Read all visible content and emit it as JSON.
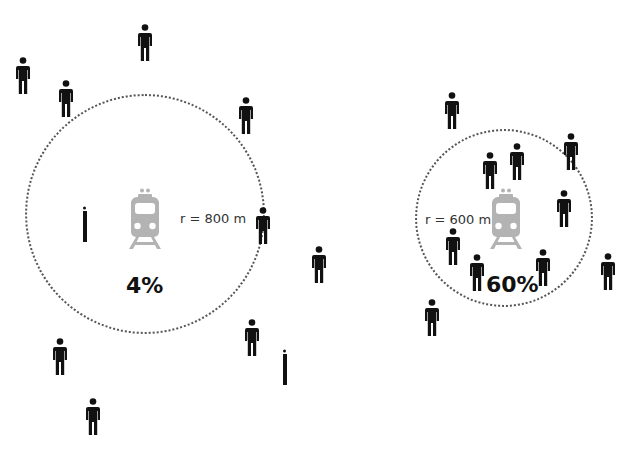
{
  "diagrams": [
    {
      "id": "left",
      "radius_label": "r = 800 m",
      "share_label": "4%",
      "ring": {
        "cx": 145,
        "cy": 214,
        "r": 120
      },
      "train": {
        "x": 126,
        "y": 188
      },
      "radius_label_pos": {
        "x": 180,
        "y": 211
      },
      "share_label_pos": {
        "x": 126,
        "y": 273
      },
      "people": [
        {
          "x": 137,
          "y": 24
        },
        {
          "x": 15,
          "y": 57
        },
        {
          "x": 58,
          "y": 80
        },
        {
          "x": 238,
          "y": 97
        },
        {
          "x": 255,
          "y": 207
        },
        {
          "x": 311,
          "y": 246
        },
        {
          "x": 244,
          "y": 319
        },
        {
          "x": 52,
          "y": 338
        },
        {
          "x": 85,
          "y": 398
        },
        {
          "x": 76,
          "y": 205,
          "partial": true
        },
        {
          "x": 276,
          "y": 348,
          "partial": true
        }
      ]
    },
    {
      "id": "right",
      "radius_label": "r = 600 m",
      "share_label": "60%",
      "ring": {
        "cx": 504,
        "cy": 218,
        "r": 89
      },
      "train": {
        "x": 487,
        "y": 188
      },
      "radius_label_pos": {
        "x": 425,
        "y": 212
      },
      "share_label_pos": {
        "x": 486,
        "y": 272
      },
      "people": [
        {
          "x": 444,
          "y": 92
        },
        {
          "x": 563,
          "y": 133
        },
        {
          "x": 509,
          "y": 143
        },
        {
          "x": 482,
          "y": 152
        },
        {
          "x": 556,
          "y": 190
        },
        {
          "x": 445,
          "y": 228
        },
        {
          "x": 469,
          "y": 254
        },
        {
          "x": 535,
          "y": 249
        },
        {
          "x": 600,
          "y": 253
        },
        {
          "x": 424,
          "y": 299
        }
      ]
    }
  ],
  "colors": {
    "person": "#111111",
    "train": "#b3b3b3",
    "ring": "#555555"
  }
}
